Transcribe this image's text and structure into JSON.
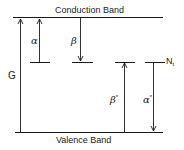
{
  "diagram": {
    "title_top": "Conduction Band",
    "title_bottom": "Valence Band",
    "labels": {
      "generation": "G",
      "alpha": "α",
      "beta": "β",
      "beta_star": "β",
      "beta_star_sup": "*",
      "alpha_star": "α",
      "alpha_star_sup": "*",
      "trap_base": "N",
      "trap_sub": "t"
    },
    "transitions": [
      {
        "name": "G",
        "direction": "up",
        "from": "Valence Band",
        "to": "Conduction Band"
      },
      {
        "name": "α",
        "direction": "up",
        "from": "trap level",
        "to": "Conduction Band"
      },
      {
        "name": "β",
        "direction": "down",
        "from": "Conduction Band",
        "to": "trap level"
      },
      {
        "name": "β*",
        "direction": "up",
        "from": "Valence Band",
        "to": "trap level"
      },
      {
        "name": "α*",
        "direction": "down",
        "from": "trap level",
        "to": "Valence Band"
      }
    ],
    "line_color": "#1a1a1a"
  }
}
